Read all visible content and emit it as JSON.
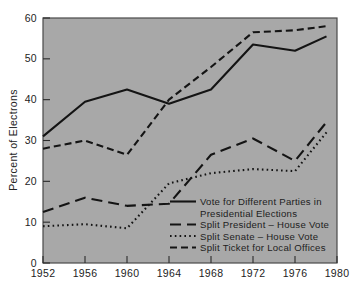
{
  "chart_data": {
    "type": "line",
    "title": "",
    "xlabel": "",
    "ylabel": "Percent of Electrons",
    "xlim": [
      1952,
      1980
    ],
    "ylim": [
      0,
      60
    ],
    "xticks": [
      "1952",
      "1956",
      "1960",
      "1964",
      "1968",
      "1972",
      "1976",
      "1980"
    ],
    "xtick_values": [
      1952,
      1956,
      1960,
      1964,
      1968,
      1972,
      1976,
      1980
    ],
    "yticks": [
      "0",
      "10",
      "20",
      "30",
      "40",
      "50",
      "60"
    ],
    "ytick_values": [
      0,
      10,
      20,
      30,
      40,
      50,
      60
    ],
    "grid": false,
    "legend_position": "inside-lower-right",
    "background_color": "#a8a8a8",
    "line_color": "#141414",
    "series": [
      {
        "name": "Vote for Different Parties in Presidential Elections",
        "style": "solid",
        "x": [
          1952,
          1956,
          1960,
          1964,
          1968,
          1972,
          1976,
          1979
        ],
        "values": [
          31,
          39.5,
          42.5,
          39,
          42.5,
          53.5,
          52,
          55.5
        ]
      },
      {
        "name": "Split President - House Vote",
        "style": "long-dash",
        "x": [
          1952,
          1956,
          1960,
          1964,
          1968,
          1972,
          1976,
          1979
        ],
        "values": [
          12.5,
          16,
          14,
          14.5,
          26.5,
          30.5,
          25,
          34.5
        ]
      },
      {
        "name": "Split Senate - House Vote",
        "style": "dotted",
        "x": [
          1952,
          1956,
          1960,
          1964,
          1968,
          1972,
          1976,
          1979
        ],
        "values": [
          9,
          9.5,
          8.5,
          19.5,
          22,
          23,
          22.5,
          32
        ]
      },
      {
        "name": "Split Ticket for Local Offices",
        "style": "short-dash",
        "x": [
          1952,
          1956,
          1960,
          1964,
          1968,
          1972,
          1976,
          1979
        ],
        "values": [
          28,
          30,
          26.5,
          40,
          48,
          56.5,
          57,
          58
        ]
      }
    ]
  },
  "legend": {
    "entries": [
      {
        "label_line1": "Vote for Different Parties in",
        "label_line2": "Presidential Elections",
        "style": "solid"
      },
      {
        "label_line1": "Split President – House Vote",
        "label_line2": "",
        "style": "long-dash"
      },
      {
        "label_line1": "Split Senate – House Vote",
        "label_line2": "",
        "style": "dotted"
      },
      {
        "label_line1": "Split Ticket for Local Offices",
        "label_line2": "",
        "style": "short-dash"
      }
    ]
  }
}
